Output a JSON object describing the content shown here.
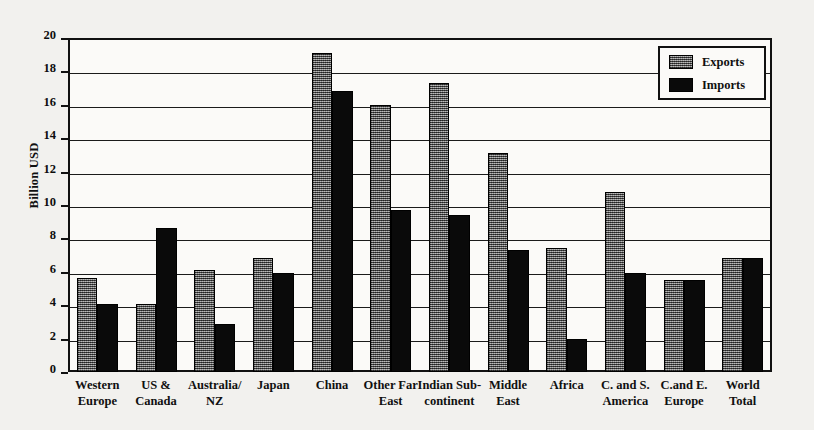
{
  "chart_data": {
    "type": "bar",
    "title": "",
    "xlabel": "",
    "ylabel": "Billion USD",
    "ylim": [
      0,
      20
    ],
    "yticks": [
      0,
      2,
      4,
      6,
      8,
      10,
      12,
      14,
      16,
      18,
      20
    ],
    "grid": true,
    "legend_position": "top-right",
    "categories": [
      "Western Europe",
      "US & Canada",
      "Australia/ NZ",
      "Japan",
      "China",
      "Other Far East",
      "Indian Sub-continent",
      "Middle East",
      "Africa",
      "C. and S. America",
      "C.and E. Europe",
      "World Total"
    ],
    "category_lines": [
      [
        "Western",
        "Europe"
      ],
      [
        "US &",
        "Canada"
      ],
      [
        "Australia/",
        "NZ"
      ],
      [
        "Japan",
        ""
      ],
      [
        "China",
        ""
      ],
      [
        "Other Far",
        "East"
      ],
      [
        "Indian Sub-",
        "continent"
      ],
      [
        "Middle",
        "East"
      ],
      [
        "Africa",
        ""
      ],
      [
        "C. and S.",
        "America"
      ],
      [
        "C.and E.",
        "Europe"
      ],
      [
        "World",
        "Total"
      ]
    ],
    "series": [
      {
        "name": "Exports",
        "color": "#6e6e6e",
        "values": [
          5.6,
          4.1,
          6.1,
          6.8,
          19.1,
          16.0,
          17.3,
          13.1,
          7.4,
          10.8,
          5.5,
          6.8
        ]
      },
      {
        "name": "Imports",
        "color": "#0a0a0a",
        "values": [
          4.1,
          8.6,
          2.9,
          5.9,
          16.8,
          9.7,
          9.4,
          7.3,
          2.0,
          5.9,
          5.5,
          6.85
        ]
      }
    ]
  },
  "legend": {
    "items": [
      {
        "label": "Exports"
      },
      {
        "label": "Imports"
      }
    ]
  },
  "axis": {
    "y_title": "Billion USD"
  }
}
